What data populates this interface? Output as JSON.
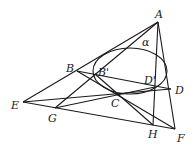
{
  "diagram": {
    "type": "projective-geometry-figure",
    "conic_label": "α",
    "points": [
      {
        "name": "A",
        "label": "A",
        "x": 158,
        "y": 22,
        "lx": 155,
        "ly": 18
      },
      {
        "name": "B",
        "label": "B",
        "x": 77,
        "y": 71,
        "lx": 66,
        "ly": 72
      },
      {
        "name": "B'",
        "label": "B'",
        "x": 95,
        "y": 74,
        "lx": 98,
        "ly": 76
      },
      {
        "name": "C",
        "label": "C",
        "x": 117,
        "y": 93,
        "lx": 111,
        "ly": 107
      },
      {
        "name": "D'",
        "label": "D'",
        "x": 155,
        "y": 87,
        "lx": 144,
        "ly": 84
      },
      {
        "name": "D",
        "label": "D",
        "x": 171,
        "y": 89,
        "lx": 175,
        "ly": 94
      },
      {
        "name": "E",
        "label": "E",
        "x": 23,
        "y": 102,
        "lx": 11,
        "ly": 109
      },
      {
        "name": "G",
        "label": "G",
        "x": 55,
        "y": 108,
        "lx": 48,
        "ly": 122
      },
      {
        "name": "H",
        "label": "H",
        "x": 153,
        "y": 125,
        "lx": 148,
        "ly": 138
      },
      {
        "name": "F",
        "label": "F",
        "x": 175,
        "y": 129,
        "lx": 177,
        "ly": 142
      }
    ],
    "segments": [
      [
        "A",
        "E"
      ],
      [
        "A",
        "F"
      ],
      [
        "A",
        "H"
      ],
      [
        "E",
        "F"
      ],
      [
        "E",
        "D"
      ],
      [
        "B",
        "D"
      ],
      [
        "B",
        "F"
      ],
      [
        "G",
        "A"
      ],
      [
        "B'",
        "H"
      ],
      [
        "G",
        "D'"
      ]
    ],
    "ellipse": {
      "cx": 130,
      "cy": 71,
      "rx": 37,
      "ry": 23,
      "label_x": 142,
      "label_y": 46
    }
  }
}
